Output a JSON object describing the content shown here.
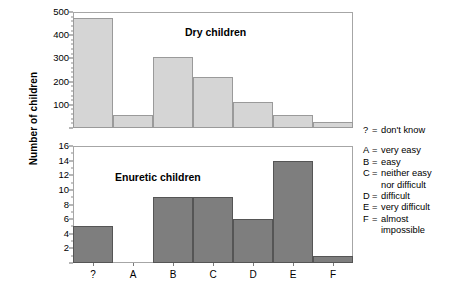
{
  "axis": {
    "y_title": "Number of children"
  },
  "chart_data": [
    {
      "type": "bar",
      "title": "Dry children",
      "xlabel": "",
      "ylabel": "Number of children",
      "categories": [
        "?",
        "A",
        "B",
        "C",
        "D",
        "E",
        "F"
      ],
      "values": [
        475,
        55,
        305,
        220,
        110,
        55,
        25
      ],
      "ylim": [
        0,
        500
      ],
      "yticks": [
        0,
        100,
        200,
        300,
        400,
        500
      ],
      "ytick_labels": [
        "",
        "100",
        "200",
        "300",
        "400",
        "500"
      ],
      "grid": false,
      "legend": "none",
      "bar_color": "#d5d5d5"
    },
    {
      "type": "bar",
      "title": "Enuretic children",
      "xlabel": "",
      "ylabel": "Number of children",
      "categories": [
        "?",
        "A",
        "B",
        "C",
        "D",
        "E",
        "F"
      ],
      "values": [
        5,
        0,
        9,
        9,
        6,
        14,
        1
      ],
      "ylim": [
        0,
        16
      ],
      "yticks": [
        0,
        2,
        4,
        6,
        8,
        10,
        12,
        14,
        16
      ],
      "ytick_labels": [
        "",
        "2",
        "4",
        "6",
        "8",
        "10",
        "12",
        "14",
        "16"
      ],
      "grid": false,
      "legend": "none",
      "bar_color": "#7e7e7e"
    }
  ],
  "legend": {
    "first": {
      "key": "?",
      "eq": "=",
      "value": "don't know"
    },
    "items": [
      {
        "key": "A",
        "eq": "=",
        "value": "very easy",
        "cont": ""
      },
      {
        "key": "B",
        "eq": "=",
        "value": "easy",
        "cont": ""
      },
      {
        "key": "C",
        "eq": "=",
        "value": "neither easy",
        "cont": "nor difficult"
      },
      {
        "key": "D",
        "eq": "=",
        "value": "difficult",
        "cont": ""
      },
      {
        "key": "E",
        "eq": "=",
        "value": "very difficult",
        "cont": ""
      },
      {
        "key": "F",
        "eq": "=",
        "value": "almost",
        "cont": "impossible"
      }
    ]
  }
}
